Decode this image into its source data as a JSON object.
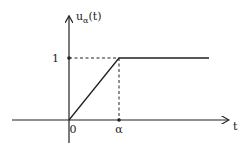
{
  "chart_data": {
    "type": "line",
    "title": "",
    "xlabel": "t",
    "ylabel": "u_α(t)",
    "ylabel_main": "u",
    "ylabel_sub": "α",
    "ylabel_tail": "(t)",
    "x_ticks": [
      {
        "value": 0,
        "label": "0"
      },
      {
        "value": 1,
        "label": "α"
      }
    ],
    "y_ticks": [
      {
        "value": 1,
        "label": "1"
      }
    ],
    "series": [
      {
        "name": "u_alpha",
        "points": [
          [
            0,
            0
          ],
          [
            1,
            1
          ],
          [
            2.8,
            1
          ]
        ]
      }
    ],
    "guides": [
      {
        "from": [
          0,
          1
        ],
        "to": [
          1,
          1
        ],
        "style": "dashed"
      },
      {
        "from": [
          1,
          1
        ],
        "to": [
          1,
          0
        ],
        "style": "dashed"
      }
    ],
    "xlim": [
      -1.14,
      3.2
    ],
    "ylim": [
      -0.37,
      1.68
    ],
    "grid": false,
    "legend": "none"
  }
}
